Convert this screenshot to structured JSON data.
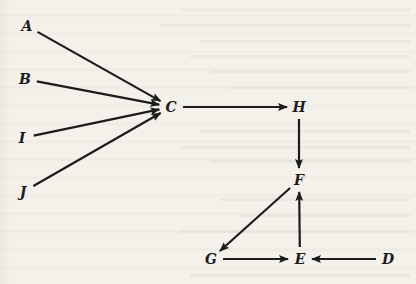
{
  "diagram": {
    "type": "directed-graph",
    "background_color": "#f2f0e8",
    "ink_color": "#1c1c1c",
    "nodes": [
      {
        "id": "A",
        "label": "A",
        "x": 27,
        "y": 26
      },
      {
        "id": "B",
        "label": "B",
        "x": 25,
        "y": 79
      },
      {
        "id": "I",
        "label": "I",
        "x": 22,
        "y": 138
      },
      {
        "id": "J",
        "label": "J",
        "x": 23,
        "y": 192
      },
      {
        "id": "C",
        "label": "C",
        "x": 171,
        "y": 107
      },
      {
        "id": "H",
        "label": "H",
        "x": 299,
        "y": 107
      },
      {
        "id": "F",
        "label": "F",
        "x": 299,
        "y": 180
      },
      {
        "id": "G",
        "label": "G",
        "x": 211,
        "y": 259
      },
      {
        "id": "E",
        "label": "E",
        "x": 300,
        "y": 259
      },
      {
        "id": "D",
        "label": "D",
        "x": 388,
        "y": 259
      }
    ],
    "edges": [
      {
        "from": "A",
        "to": "C"
      },
      {
        "from": "B",
        "to": "C"
      },
      {
        "from": "I",
        "to": "C"
      },
      {
        "from": "J",
        "to": "C"
      },
      {
        "from": "C",
        "to": "H"
      },
      {
        "from": "H",
        "to": "F"
      },
      {
        "from": "F",
        "to": "G"
      },
      {
        "from": "G",
        "to": "E"
      },
      {
        "from": "E",
        "to": "F"
      },
      {
        "from": "D",
        "to": "E"
      }
    ]
  }
}
